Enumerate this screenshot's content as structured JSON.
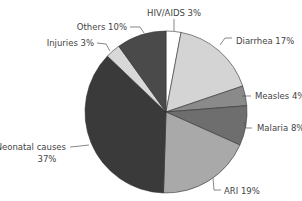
{
  "chart_data": {
    "type": "pie",
    "title": "",
    "start_angle_deg": 0,
    "direction": "clockwise",
    "slices": [
      {
        "label": "HIV/AIDS",
        "value": 3,
        "text": "HIV/AIDS 3%",
        "color": "#ffffff"
      },
      {
        "label": "Diarrhea",
        "value": 17,
        "text": "Diarrhea 17%",
        "color": "#d4d4d4"
      },
      {
        "label": "Measles",
        "value": 4,
        "text": "Measles 4%",
        "color": "#8a8a8a"
      },
      {
        "label": "Malaria",
        "value": 8,
        "text": "Malaria 8%",
        "color": "#6e6e6e"
      },
      {
        "label": "ARI",
        "value": 19,
        "text": "ARI 19%",
        "color": "#a9a9a9"
      },
      {
        "label": "Neonatal causes",
        "value": 37,
        "text": "Neonatal causes 37%",
        "color": "#3a3a3a"
      },
      {
        "label": "Injuries",
        "value": 3,
        "text": "Injuries 3%",
        "color": "#d8d8d8"
      },
      {
        "label": "Others",
        "value": 10,
        "text": "Others 10%",
        "color": "#4a4a4a"
      }
    ],
    "legend": "none (callout labels)",
    "unit": "%"
  },
  "labels": {
    "hiv": "HIV/AIDS 3%",
    "diarrhea": "Diarrhea 17%",
    "measles": "Measles 4%",
    "malaria": "Malaria 8%",
    "ari": "ARI 19%",
    "neonatal_1": "Neonatal causes",
    "neonatal_2": "37%",
    "injuries": "Injuries 3%",
    "others": "Others 10%"
  }
}
